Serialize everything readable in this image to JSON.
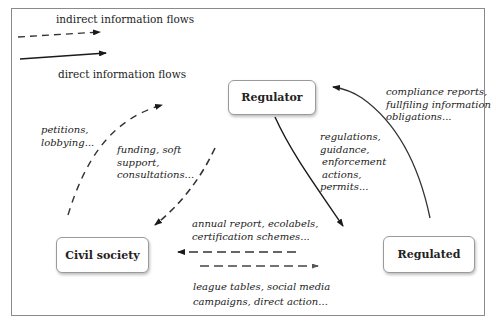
{
  "legend": {
    "indirect_label": "indirect information flows",
    "direct_label": "direct information flows"
  },
  "nodes": {
    "regulator": "Regulator",
    "civil_society": "Civil society",
    "regulated": "Regulated"
  },
  "flows": {
    "regulated_to_regulator": [
      "compliance reports,",
      "fullfiling information",
      "obligations..."
    ],
    "regulator_to_regulated": [
      "regulations,",
      "guidance,",
      "enforcement",
      "actions,",
      "permits..."
    ],
    "civil_to_regulator": [
      "petitions,",
      "lobbying..."
    ],
    "regulator_to_civil": [
      "funding, soft",
      "support,",
      "consultations..."
    ],
    "regulated_to_civil": [
      "annual report, ecolabels,",
      "certification schemes..."
    ],
    "civil_to_regulated": [
      "league tables, social media",
      "campaigns, direct action..."
    ]
  },
  "colors": {
    "direct": "#1a1a1a",
    "indirect": "#333333",
    "frame": "#8a8a8a"
  }
}
